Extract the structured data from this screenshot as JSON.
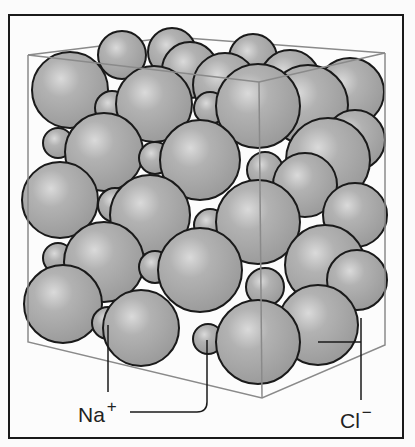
{
  "labels": {
    "sodium": {
      "symbol": "Na",
      "charge": "+"
    },
    "chloride": {
      "symbol": "Cl",
      "charge": "−"
    }
  },
  "colors": {
    "sphere_fill": "#a8a8a8",
    "sphere_outline": "#1a1a1a",
    "cube_edge": "#8a8a8a",
    "frame": "#1a1a1a"
  }
}
